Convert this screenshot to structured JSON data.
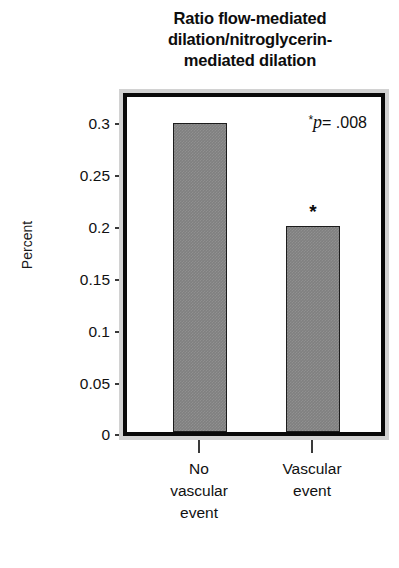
{
  "chart_data": {
    "type": "bar",
    "title_lines": [
      "Ratio flow-mediated",
      "dilation/nitroglycerin-",
      "mediated dilation"
    ],
    "categories": [
      "No vascular event",
      "Vascular event"
    ],
    "category_lines": [
      [
        "No",
        "vascular",
        "event"
      ],
      [
        "Vascular",
        "event"
      ]
    ],
    "values": [
      0.3,
      0.2
    ],
    "xlabel": "",
    "ylabel": "Percent",
    "ylim": [
      0,
      0.325
    ],
    "yticks": [
      0,
      0.05,
      0.1,
      0.15,
      0.2,
      0.25,
      0.3
    ],
    "ytick_labels": [
      "0",
      "0.05",
      "0.1",
      "0.15",
      "0.2",
      "0.25",
      "0.3"
    ],
    "grid": false,
    "legend": false,
    "annotations": [
      {
        "name": "p-value",
        "star": "*",
        "p_symbol": "p",
        "text": "= .008",
        "full_text": "* p = .008",
        "position": "top-right"
      },
      {
        "name": "significance-star",
        "text": "*",
        "attached_to_category": "Vascular event"
      }
    ],
    "colors": {
      "bar_fill": "#808080",
      "bar_outline": "#1c1c1c",
      "frame_outer": "#d2d2d2",
      "frame_inner": "#0a0a0a",
      "background": "#ffffff",
      "text": "#111111"
    }
  }
}
